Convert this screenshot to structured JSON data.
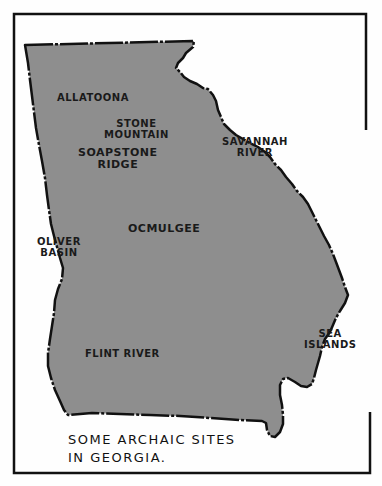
{
  "map": {
    "title": "Some Archaic Sites in Georgia",
    "region": "Georgia",
    "colors": {
      "state_fill": "#8e8e8e",
      "border": "#111111",
      "background": "#fefefe"
    },
    "sites": [
      {
        "id": "allatoona",
        "label": "ALLATOONA"
      },
      {
        "id": "stone-mountain",
        "label_line1": "STONE",
        "label_line2": "MOUNTAIN"
      },
      {
        "id": "soapstone-ridge",
        "label_line1": "SOAPSTONE",
        "label_line2": "RIDGE"
      },
      {
        "id": "savannah-river",
        "label_line1": "SAVANNAH",
        "label_line2": "RIVER"
      },
      {
        "id": "ocmulgee",
        "label": "OCMULGEE"
      },
      {
        "id": "oliver-basin",
        "label_line1": "OLIVER",
        "label_line2": "BASIN"
      },
      {
        "id": "sea-islands",
        "label_line1": "SEA",
        "label_line2": "ISLANDS"
      },
      {
        "id": "flint-river",
        "label": "FLINT RIVER"
      }
    ],
    "caption_line1": "SOME ARCHAIC SITES",
    "caption_line2": "IN GEORGIA."
  }
}
